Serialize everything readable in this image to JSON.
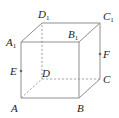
{
  "figure": {
    "type": "cube",
    "colors": {
      "background": "#ffffff",
      "edge": "#8f8f8f",
      "label": "#222222"
    },
    "vertices": {
      "A": {
        "label": "A",
        "sub": "",
        "x": 21,
        "y": 98
      },
      "B": {
        "label": "B",
        "sub": "",
        "x": 79,
        "y": 98
      },
      "C": {
        "label": "C",
        "sub": "",
        "x": 100,
        "y": 79
      },
      "D": {
        "label": "D",
        "sub": "",
        "x": 42,
        "y": 79
      },
      "A1": {
        "label": "A",
        "sub": "1",
        "x": 21,
        "y": 42
      },
      "B1": {
        "label": "B",
        "sub": "1",
        "x": 79,
        "y": 42
      },
      "C1": {
        "label": "C",
        "sub": "1",
        "x": 100,
        "y": 23
      },
      "D1": {
        "label": "D",
        "sub": "1",
        "x": 42,
        "y": 23
      }
    },
    "points": {
      "E": {
        "label": "E",
        "on_edge": "AA1",
        "x": 21,
        "y": 71
      },
      "F": {
        "label": "F",
        "on_edge": "CC1",
        "x": 100,
        "y": 54
      }
    },
    "visible_edges": [
      "AB",
      "BB1",
      "B1A1",
      "A1A",
      "A1D1",
      "D1C1",
      "C1B1",
      "C1C",
      "CB"
    ],
    "hidden_edges": [
      "AD",
      "DC",
      "DD1"
    ]
  }
}
